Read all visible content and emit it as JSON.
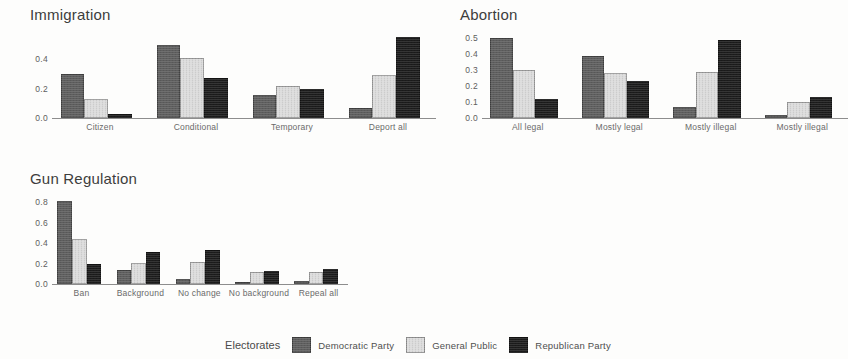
{
  "legend": {
    "title": "Electorates",
    "entries": [
      {
        "label": "Democratic Party",
        "color": "#5e5e5e"
      },
      {
        "label": "General Public",
        "color": "#dcdcdc"
      },
      {
        "label": "Republican Party",
        "color": "#1c1c1c"
      }
    ]
  },
  "chart_data": [
    {
      "type": "bar",
      "title": "Immigration",
      "xlabel": "",
      "ylabel": "",
      "ylim": [
        0,
        0.6
      ],
      "yticks": [
        "0.0",
        "0.2",
        "0.4"
      ],
      "ytick_values": [
        0.0,
        0.2,
        0.4
      ],
      "grid": false,
      "legend_position": "bottom-shared",
      "categories": [
        "Citizen",
        "Conditional",
        "Temporary",
        "Deport all"
      ],
      "series": [
        {
          "name": "Democratic Party",
          "values": [
            0.3,
            0.5,
            0.16,
            0.07
          ]
        },
        {
          "name": "General Public",
          "values": [
            0.13,
            0.41,
            0.22,
            0.29
          ]
        },
        {
          "name": "Republican Party",
          "values": [
            0.03,
            0.27,
            0.2,
            0.55
          ]
        }
      ]
    },
    {
      "type": "bar",
      "title": "Abortion",
      "xlabel": "",
      "ylabel": "",
      "ylim": [
        0,
        0.55
      ],
      "yticks": [
        "0.0",
        "0.1",
        "0.2",
        "0.3",
        "0.4",
        "0.5"
      ],
      "ytick_values": [
        0.0,
        0.1,
        0.2,
        0.3,
        0.4,
        0.5
      ],
      "grid": false,
      "legend_position": "bottom-shared",
      "categories": [
        "All legal",
        "Mostly legal",
        "Mostly illegal",
        "Mostly illegal"
      ],
      "series": [
        {
          "name": "Democratic Party",
          "values": [
            0.5,
            0.39,
            0.07,
            0.02
          ]
        },
        {
          "name": "General Public",
          "values": [
            0.3,
            0.28,
            0.29,
            0.1
          ]
        },
        {
          "name": "Republican Party",
          "values": [
            0.12,
            0.23,
            0.49,
            0.13
          ]
        }
      ]
    },
    {
      "type": "bar",
      "title": "Gun Regulation",
      "xlabel": "",
      "ylabel": "",
      "ylim": [
        0,
        0.88
      ],
      "yticks": [
        "0.0",
        "0.2",
        "0.4",
        "0.6",
        "0.8"
      ],
      "ytick_values": [
        0.0,
        0.2,
        0.4,
        0.6,
        0.8
      ],
      "grid": false,
      "legend_position": "bottom-shared",
      "categories": [
        "Ban",
        "Background",
        "No change",
        "No background",
        "Repeal all"
      ],
      "series": [
        {
          "name": "Democratic Party",
          "values": [
            0.81,
            0.14,
            0.05,
            0.02,
            0.03
          ]
        },
        {
          "name": "General Public",
          "values": [
            0.44,
            0.21,
            0.22,
            0.12,
            0.12
          ]
        },
        {
          "name": "Republican Party",
          "values": [
            0.2,
            0.31,
            0.33,
            0.13,
            0.15
          ]
        }
      ]
    }
  ]
}
